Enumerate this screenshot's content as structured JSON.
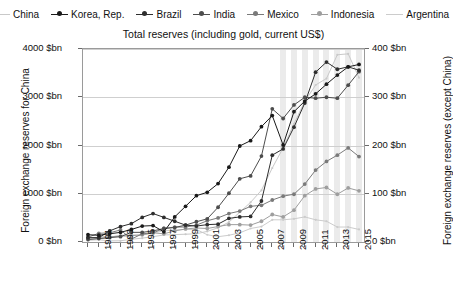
{
  "chart_data": {
    "type": "line",
    "title": "Total reserves (including gold, current US$)",
    "xlabel": "",
    "ylabel": "Foreign exchange reserves for China",
    "y2label": "Foreign exchange reserves (except China)",
    "ylim": [
      0,
      4000
    ],
    "y2lim": [
      0,
      400
    ],
    "ytick_labels": [
      "0 $bn",
      "1000 $bn",
      "2000 $bn",
      "3000 $bn",
      "4000 $bn"
    ],
    "ytick_values": [
      0,
      1000,
      2000,
      3000,
      4000
    ],
    "y2tick_labels": [
      "0 $bn",
      "100 $bn",
      "200 $bn",
      "300 $bn",
      "400 $bn"
    ],
    "y2tick_values": [
      0,
      100,
      200,
      300,
      400
    ],
    "grid": "horizontal",
    "legend_position": "top",
    "x": [
      1990,
      1991,
      1992,
      1993,
      1994,
      1995,
      1996,
      1997,
      1998,
      1999,
      2000,
      2001,
      2002,
      2003,
      2004,
      2005,
      2006,
      2007,
      2008,
      2009,
      2010,
      2011,
      2012,
      2013,
      2014,
      2015
    ],
    "xtick_labels": [
      "1991",
      "1993",
      "1995",
      "1997",
      "1999",
      "2001",
      "2003",
      "2005",
      "2007",
      "2009",
      "2011",
      "2013",
      "2015"
    ],
    "xtick_values": [
      1991,
      1993,
      1995,
      1997,
      1999,
      2001,
      2003,
      2005,
      2007,
      2009,
      2011,
      2013,
      2015
    ],
    "series": [
      {
        "name": "China",
        "axis": "left",
        "color": "#c9c9c9",
        "values": [
          34,
          47,
          24,
          25,
          56,
          80,
          111,
          146,
          153,
          161,
          171,
          220,
          295,
          412,
          618,
          822,
          1072,
          1534,
          1951,
          2451,
          2914,
          3254,
          3388,
          3880,
          3900,
          3406
        ]
      },
      {
        "name": "Korea, Rep.",
        "axis": "right",
        "color": "#1a1a1a",
        "values": [
          15,
          14,
          17,
          20,
          26,
          33,
          34,
          21,
          52,
          74,
          96,
          103,
          121,
          155,
          199,
          210,
          239,
          262,
          201,
          270,
          292,
          307,
          327,
          346,
          363,
          368
        ]
      },
      {
        "name": "Brazil",
        "axis": "right",
        "color": "#2e2e2e",
        "values": [
          9,
          9,
          23,
          32,
          38,
          51,
          59,
          51,
          43,
          35,
          33,
          36,
          37,
          49,
          52,
          53,
          85,
          180,
          193,
          238,
          288,
          352,
          373,
          358,
          363,
          356
        ]
      },
      {
        "name": "India",
        "axis": "right",
        "color": "#4d4d4d",
        "values": [
          5,
          7,
          9,
          11,
          20,
          20,
          23,
          28,
          30,
          35,
          42,
          48,
          72,
          101,
          131,
          137,
          178,
          276,
          256,
          284,
          300,
          298,
          300,
          298,
          325,
          353
        ]
      },
      {
        "name": "Mexico",
        "axis": "right",
        "color": "#7a7a7a",
        "values": [
          10,
          18,
          19,
          25,
          6,
          17,
          19,
          28,
          31,
          31,
          35,
          44,
          50,
          59,
          64,
          74,
          76,
          87,
          95,
          99,
          120,
          149,
          167,
          180,
          195,
          177
        ]
      },
      {
        "name": "Indonesia",
        "axis": "right",
        "color": "#9e9e9e",
        "values": [
          8,
          10,
          11,
          12,
          13,
          15,
          19,
          17,
          23,
          27,
          29,
          28,
          32,
          36,
          36,
          35,
          43,
          57,
          52,
          66,
          96,
          110,
          113,
          99,
          112,
          106
        ]
      },
      {
        "name": "Argentina",
        "axis": "right",
        "color": "#cccccc",
        "values": [
          6,
          7,
          10,
          14,
          15,
          14,
          19,
          23,
          25,
          26,
          26,
          15,
          11,
          14,
          19,
          28,
          32,
          46,
          46,
          48,
          52,
          46,
          43,
          31,
          31,
          26
        ]
      }
    ],
    "shaded_bands_years": [
      2008,
      2009,
      2010,
      2011,
      2012,
      2013,
      2014,
      2015
    ]
  },
  "legend": {
    "items": [
      {
        "label": "China",
        "marker": "line-light"
      },
      {
        "label": "Korea, Rep.",
        "marker": "line-dot-dark"
      },
      {
        "label": "Brazil",
        "marker": "line-dot-dark"
      },
      {
        "label": "India",
        "marker": "line-dot-mid"
      },
      {
        "label": "Mexico",
        "marker": "line-dot-gray"
      },
      {
        "label": "Indonesia",
        "marker": "line-dot-lightgray"
      },
      {
        "label": "Argentina",
        "marker": "line-lighter"
      }
    ]
  }
}
